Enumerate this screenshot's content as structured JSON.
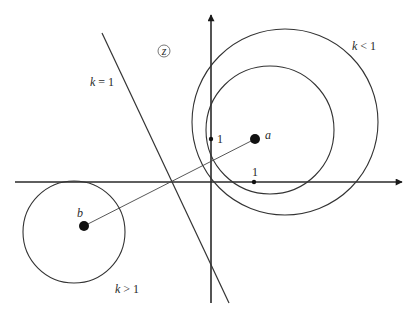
{
  "diagram": {
    "type": "complex-plane-apollonius-circles",
    "plane_symbol": "z",
    "colors": {
      "stroke": "#333333",
      "axis": "#2a2a2a",
      "background": "#ffffff"
    },
    "axes": {
      "x_axis": {
        "from": [
          15,
          182
        ],
        "to": [
          402,
          182
        ]
      },
      "y_axis": {
        "from": [
          211,
          303
        ],
        "to": [
          211,
          15
        ]
      },
      "origin": [
        211,
        182
      ],
      "unit_px": 43,
      "x_tick": {
        "label": "1",
        "pos": [
          254,
          182
        ]
      },
      "y_tick": {
        "label": "1",
        "pos": [
          211,
          139
        ]
      }
    },
    "points": [
      {
        "id": "a",
        "label": "a",
        "pos": [
          255,
          139
        ]
      },
      {
        "id": "b",
        "label": "b",
        "pos": [
          84,
          226
        ]
      }
    ],
    "segment_ab": {
      "from": [
        84,
        226
      ],
      "to": [
        255,
        139
      ]
    },
    "bisector_line": {
      "label_k": "k",
      "label_rel": "= 1",
      "from": [
        102,
        33
      ],
      "to": [
        229,
        303
      ]
    },
    "circles": [
      {
        "id": "outer-k-lt-1",
        "center": [
          285,
          122
        ],
        "r": 93
      },
      {
        "id": "inner-k-lt-1",
        "center": [
          270,
          130
        ],
        "r": 64
      },
      {
        "id": "k-gt-1",
        "center": [
          74,
          232
        ],
        "r": 51
      }
    ],
    "labels": {
      "k_eq_1": {
        "k": "k",
        "rest": " = 1",
        "pos": [
          90,
          86
        ]
      },
      "k_lt_1": {
        "k": "k",
        "rest": " < 1",
        "pos": [
          352,
          50
        ]
      },
      "k_gt_1": {
        "k": "k",
        "rest": " > 1",
        "pos": [
          115,
          293
        ]
      },
      "a": {
        "text": "a",
        "pos": [
          265,
          138
        ]
      },
      "b": {
        "text": "b",
        "pos": [
          77,
          217
        ]
      },
      "one_x": {
        "text": "1",
        "pos": [
          252,
          176
        ]
      },
      "one_y": {
        "text": "1",
        "pos": [
          217,
          143
        ]
      },
      "z": {
        "text": "z",
        "pos": [
          164,
          51
        ]
      }
    }
  }
}
